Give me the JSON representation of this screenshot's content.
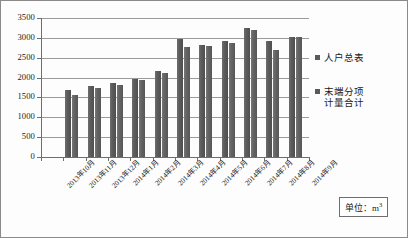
{
  "chart_data": {
    "type": "bar",
    "title": "",
    "xlabel": "",
    "ylabel": "",
    "ylim": [
      0,
      3500
    ],
    "ytick_step": 500,
    "grid": true,
    "legend_position": "right",
    "categories": [
      "2013年10月",
      "2013年11月",
      "2013年12月",
      "2014年1月",
      "2014年2月",
      "2014年3月",
      "2014年4月",
      "2014年5月",
      "2014年6月",
      "2014年7月",
      "2014年8月",
      "2014年9月"
    ],
    "yticks": [
      "0",
      "500",
      "1000",
      "1500",
      "2000",
      "2500",
      "3000",
      "3500"
    ],
    "series": [
      {
        "name": "人户总表",
        "color": "#5d5d5d",
        "values": [
          0,
          1680,
          1780,
          1870,
          1970,
          2160,
          2970,
          2830,
          2920,
          3250,
          2930,
          3020
        ]
      },
      {
        "name": "末端分项计量合计",
        "color": "#6a6a6a",
        "values": [
          0,
          1550,
          1730,
          1820,
          1950,
          2120,
          2770,
          2800,
          2880,
          3200,
          2700,
          3030
        ]
      }
    ],
    "annotation": {
      "unit_label": "单位：m",
      "unit_exponent": "3"
    }
  },
  "legend": {
    "items": [
      {
        "label": "人户总表",
        "swatch_color": "#5a5a5a"
      },
      {
        "label": "末端分项\n计量合计",
        "swatch_color": "#5a5a5a"
      }
    ]
  }
}
